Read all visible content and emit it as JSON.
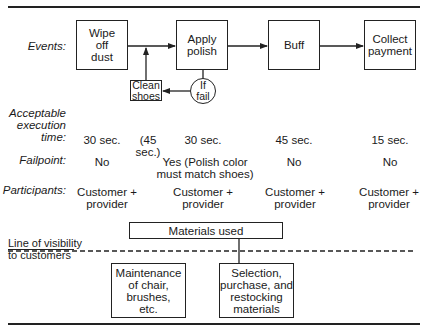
{
  "diagram": {
    "row_labels": {
      "events": "Events:",
      "execution_time": "Acceptable\nexecution\ntime:",
      "failpoint": "Failpoint:",
      "participants": "Participants:"
    },
    "events": [
      {
        "id": "wipe",
        "label": "Wipe\noff\ndust",
        "time": "30 sec.",
        "failpoint": "No",
        "participants": "Customer +\nprovider"
      },
      {
        "id": "polish",
        "label": "Apply\npolish",
        "time": "30 sec.",
        "failpoint": "Yes (Polish color\nmust match shoes)",
        "participants": "Customer +\nprovider"
      },
      {
        "id": "buff",
        "label": "Buff",
        "time": "45 sec.",
        "failpoint": "No",
        "participants": "Customer +\nprovider"
      },
      {
        "id": "payment",
        "label": "Collect\npayment",
        "time": "15 sec.",
        "failpoint": "No",
        "participants": "Customer +\nprovider"
      }
    ],
    "fail_loop": {
      "decision": "If\nfail",
      "recovery": "Clean\nshoes",
      "recovery_time": "(45 sec.)"
    },
    "materials_used": "Materials used",
    "line_of_visibility": "Line of visibility\nto customers",
    "backstage": [
      {
        "id": "maintenance",
        "label": "Maintenance\nof chair,\nbrushes,\netc."
      },
      {
        "id": "selection",
        "label": "Selection,\npurchase, and\nrestocking\nmaterials"
      }
    ],
    "colors": {
      "ink": "#222222",
      "background": "#ffffff"
    }
  }
}
